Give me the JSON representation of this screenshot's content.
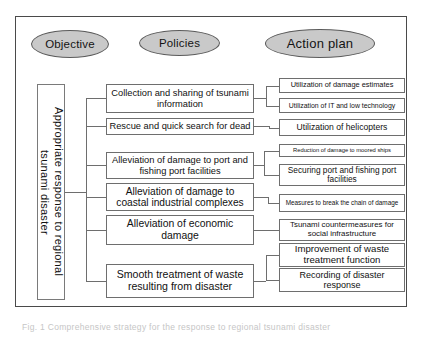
{
  "figure": {
    "caption": "Fig. 1  Comprehensive strategy for the response to regional tsunami disaster"
  },
  "headers": {
    "objective": "Objective",
    "policies": "Policies",
    "action_plan": "Action plan"
  },
  "objective": {
    "text": "Appropriate response to regional tsunami disaster"
  },
  "policies": [
    {
      "id": "p1",
      "label": "Collection and sharing of tsunami information"
    },
    {
      "id": "p2",
      "label": "Rescue and quick search for dead"
    },
    {
      "id": "p3",
      "label": "Alleviation of damage to port and fishing port facilities"
    },
    {
      "id": "p4",
      "label": "Alleviation of damage to coastal industrial complexes"
    },
    {
      "id": "p5",
      "label": "Alleviation of economic damage"
    },
    {
      "id": "p6",
      "label": "Smooth treatment of waste resulting from disaster"
    }
  ],
  "actions": [
    {
      "id": "a1",
      "label": "Utilization of damage estimates"
    },
    {
      "id": "a2",
      "label": "Utilization of IT and low technology"
    },
    {
      "id": "a3",
      "label": "Utilization of helicopters"
    },
    {
      "id": "a4",
      "label": "Reduction of damage to moored ships"
    },
    {
      "id": "a5",
      "label": "Securing port and fishing port facilities"
    },
    {
      "id": "a6",
      "label": "Measures to break the chain of damage"
    },
    {
      "id": "a7",
      "label": "Tsunami countermeasures for social infrastructure"
    },
    {
      "id": "a8",
      "label": "Improvement of waste treatment function"
    },
    {
      "id": "a9",
      "label": "Recording of disaster response"
    }
  ],
  "colors": {
    "ellipse_fill": "#c9c9c9",
    "box_border": "#6e6e6e",
    "frame_border": "#4a4a4a",
    "wire": "#6e6e6e",
    "background": "#ffffff"
  }
}
